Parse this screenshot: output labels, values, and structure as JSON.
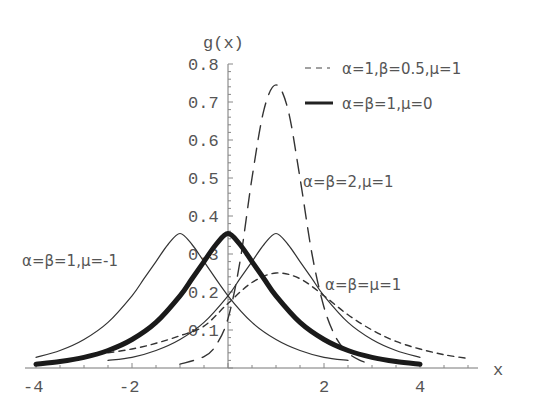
{
  "chart_data": {
    "type": "line",
    "title": "",
    "xlabel": "x",
    "ylabel": "g(x)",
    "xlim": [
      -4.2,
      5.2
    ],
    "ylim": [
      0,
      0.8
    ],
    "grid": false,
    "x_ticks": [
      -4,
      -2,
      2,
      4
    ],
    "x_tick_labels": [
      "-4",
      "-2",
      "2",
      "4"
    ],
    "y_ticks": [
      0.1,
      0.2,
      0.3,
      0.4,
      0.5,
      0.6,
      0.7,
      0.8
    ],
    "y_tick_labels": [
      "0.1",
      "0.2",
      "0.3",
      "0.4",
      "0.5",
      "0.6",
      "0.7",
      "0.8"
    ],
    "legend": [
      {
        "label": "α=1,β=0.5,μ=1",
        "style": "dashed"
      },
      {
        "label": "α=β=1,μ=0",
        "style": "thick-solid"
      }
    ],
    "annotations": [
      {
        "text": "α=β=2,μ=1",
        "x": 0.95,
        "y": 0.495
      },
      {
        "text": "α=β=1,μ=-1",
        "x": -4.4,
        "y": 0.29
      },
      {
        "text": "α=β=μ=1",
        "x": 1.9,
        "y": 0.2
      }
    ],
    "series": [
      {
        "name": "α=β=1,μ=0",
        "style": "thick-solid",
        "x": [
          -4,
          -3.5,
          -3,
          -2.5,
          -2,
          -1.5,
          -1,
          -0.75,
          -0.5,
          -0.25,
          0,
          0.25,
          0.5,
          0.75,
          1,
          1.5,
          2,
          2.5,
          3,
          3.5,
          4
        ],
        "y": [
          0.01,
          0.017,
          0.028,
          0.046,
          0.075,
          0.12,
          0.19,
          0.235,
          0.28,
          0.325,
          0.354,
          0.325,
          0.28,
          0.235,
          0.19,
          0.12,
          0.075,
          0.046,
          0.028,
          0.017,
          0.01
        ]
      },
      {
        "name": "α=β=1,μ=-1",
        "style": "thin-solid",
        "x": [
          -4,
          -3.5,
          -3,
          -2.5,
          -2,
          -1.75,
          -1.5,
          -1.25,
          -1,
          -0.75,
          -0.5,
          0,
          0.5,
          1,
          1.5,
          2,
          2.5
        ],
        "y": [
          0.028,
          0.046,
          0.075,
          0.12,
          0.19,
          0.235,
          0.28,
          0.325,
          0.354,
          0.325,
          0.28,
          0.19,
          0.12,
          0.075,
          0.046,
          0.028,
          0.02
        ]
      },
      {
        "name": "α=β=2,μ=1",
        "style": "thin-solid",
        "x": [
          -2.5,
          -2,
          -1.5,
          -1,
          -0.5,
          0,
          0.25,
          0.5,
          0.75,
          1,
          1.25,
          1.5,
          1.75,
          2,
          2.5,
          3,
          3.5,
          4
        ],
        "y": [
          0.02,
          0.028,
          0.046,
          0.075,
          0.12,
          0.19,
          0.235,
          0.28,
          0.325,
          0.354,
          0.325,
          0.28,
          0.235,
          0.19,
          0.12,
          0.075,
          0.046,
          0.028
        ]
      },
      {
        "name": "α=β=μ=1",
        "style": "short-dashed",
        "x": [
          -2.5,
          -2,
          -1.5,
          -1,
          -0.5,
          0,
          0.5,
          1,
          1.5,
          2,
          2.5,
          3,
          3.5,
          4,
          4.5,
          5
        ],
        "y": [
          0.04,
          0.05,
          0.065,
          0.085,
          0.11,
          0.17,
          0.225,
          0.25,
          0.235,
          0.19,
          0.14,
          0.1,
          0.07,
          0.05,
          0.035,
          0.025
        ]
      },
      {
        "name": "α=1,β=0.5,μ=1",
        "style": "long-dashed",
        "x": [
          -1,
          -0.5,
          -0.25,
          0,
          0.25,
          0.5,
          0.75,
          1,
          1.25,
          1.5,
          1.75,
          2,
          2.25,
          2.5,
          2.75,
          3
        ],
        "y": [
          0.01,
          0.03,
          0.06,
          0.13,
          0.28,
          0.5,
          0.68,
          0.745,
          0.68,
          0.5,
          0.3,
          0.16,
          0.08,
          0.04,
          0.02,
          0.01
        ]
      }
    ]
  }
}
